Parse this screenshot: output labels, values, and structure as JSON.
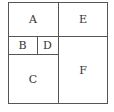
{
  "diagram": {
    "regions": [
      {
        "label": "A"
      },
      {
        "label": "E"
      },
      {
        "label": "B"
      },
      {
        "label": "D"
      },
      {
        "label": "C"
      },
      {
        "label": "F"
      }
    ]
  }
}
